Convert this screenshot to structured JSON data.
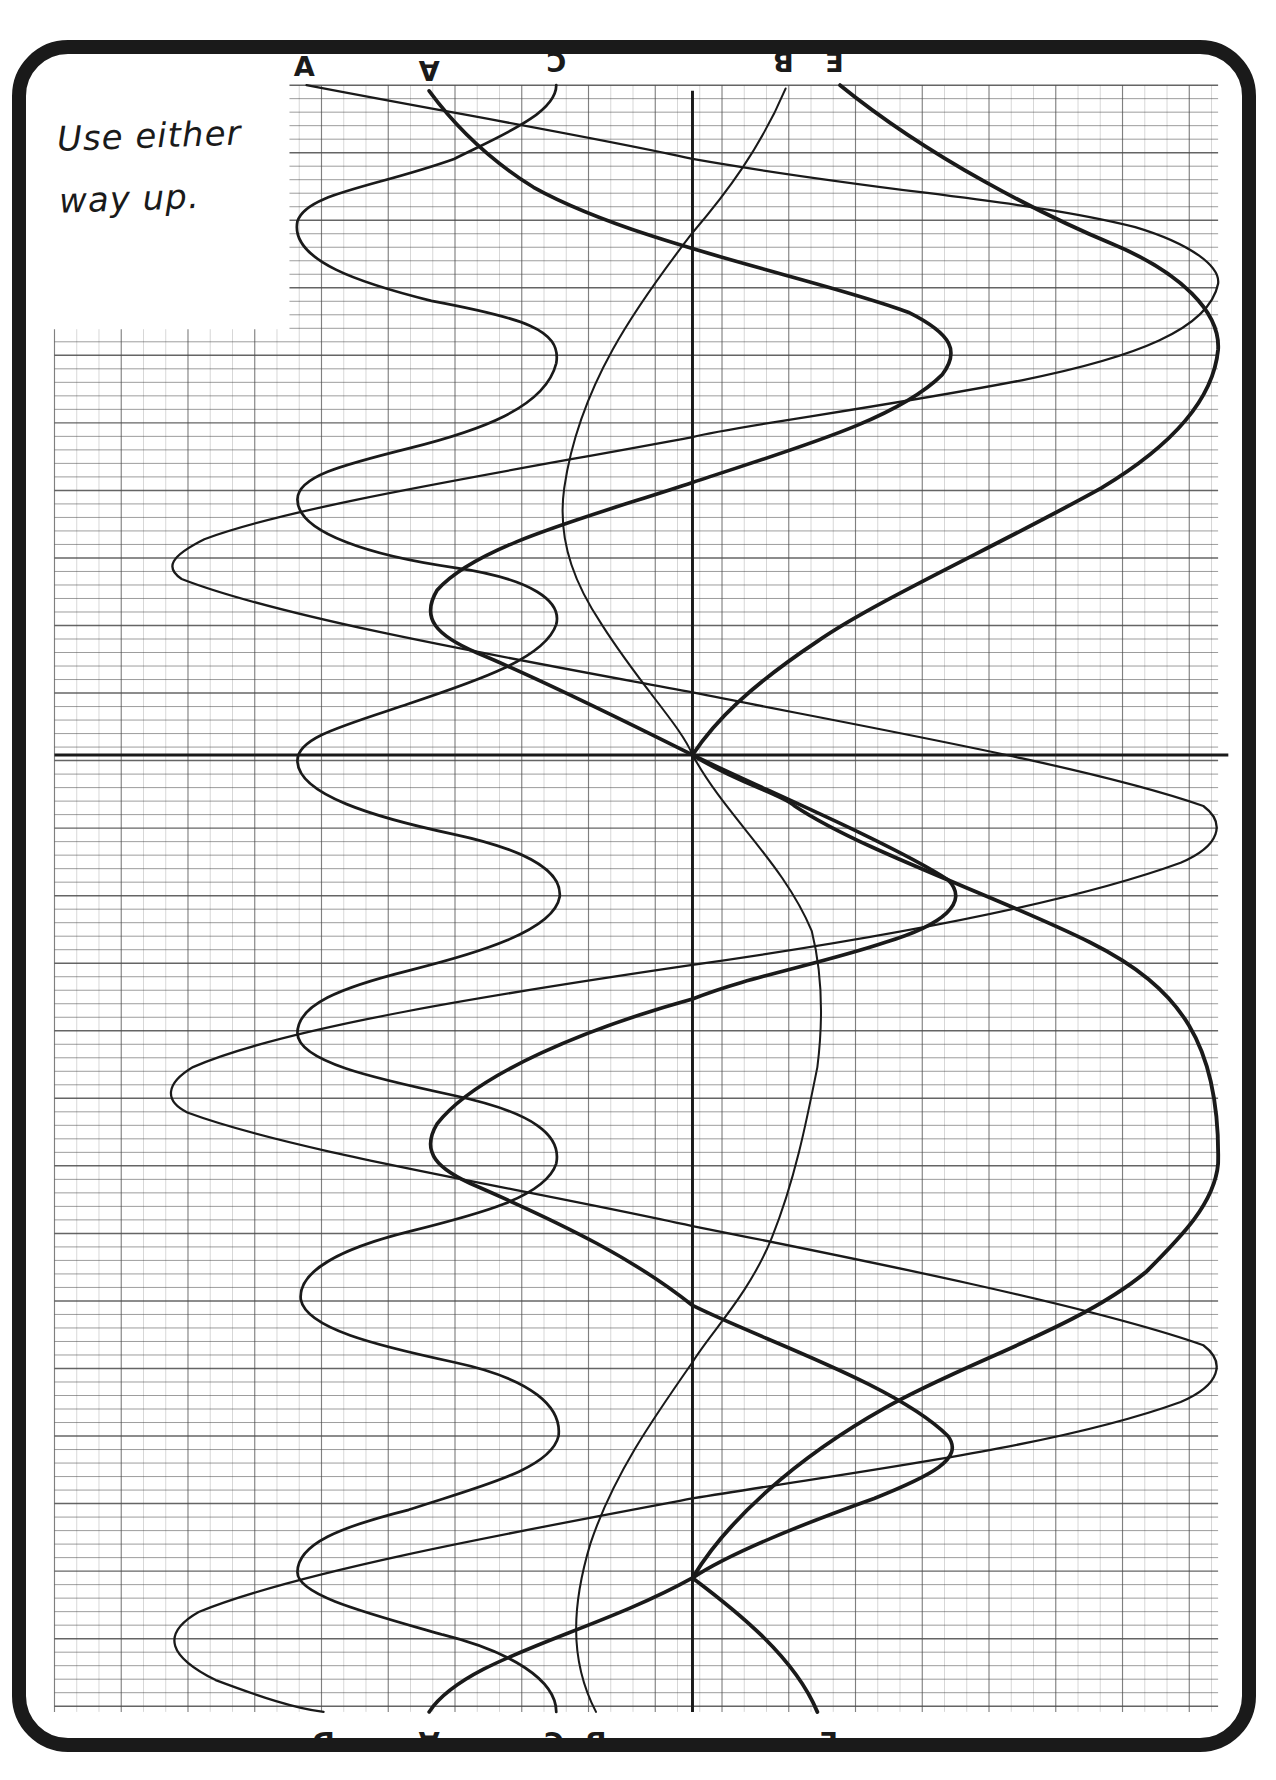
{
  "page": {
    "note_lines": [
      "Use either",
      "way up."
    ],
    "ink_color": "#1a1a1a",
    "grid_color": "#4a4a4a",
    "paper_color": "#ffffff"
  },
  "labels": {
    "top": [
      {
        "text": "A",
        "x": 268,
        "y": 60,
        "rot": 0
      },
      {
        "text": "A",
        "x": 378,
        "y": 60,
        "rot": 180
      },
      {
        "text": "C",
        "x": 490,
        "y": 52,
        "rot": 180
      },
      {
        "text": "B",
        "x": 690,
        "y": 52,
        "rot": 180
      },
      {
        "text": "E",
        "x": 735,
        "y": 52,
        "rot": 180
      }
    ],
    "bottom": [
      {
        "text": "D",
        "x": 285,
        "y": 1532,
        "rot": 180
      },
      {
        "text": "A",
        "x": 378,
        "y": 1532,
        "rot": 180
      },
      {
        "text": "C",
        "x": 488,
        "y": 1532,
        "rot": 180
      },
      {
        "text": "B",
        "x": 525,
        "y": 1532,
        "rot": 180
      },
      {
        "text": "E",
        "x": 730,
        "y": 1532,
        "rot": 180
      }
    ]
  },
  "chart_data": {
    "type": "line",
    "title": "",
    "xlabel": "",
    "ylabel": "",
    "note": "Use either way up.",
    "axes": {
      "origin": [
        610,
        665
      ],
      "x_axis_y": 665,
      "y_axis_x": 610
    },
    "series": [
      {
        "name": "A",
        "stroke_width": 3.2,
        "path": "M378,80 C400,110 430,140 470,165 C560,215 720,245 800,275 C840,295 845,310 830,330 C790,370 700,395 610,425 C520,455 420,480 385,520 C370,545 385,560 420,575 C480,600 560,640 610,665 C660,690 780,740 835,775 C855,795 830,815 780,830 C720,850 660,860 610,880 C520,905 420,945 385,990 C370,1015 385,1030 420,1045 C500,1080 560,1110 610,1150 C670,1180 790,1220 835,1265 C850,1285 820,1300 770,1320 C700,1345 640,1370 610,1390 C520,1440 410,1460 378,1508"
      },
      {
        "name": "B",
        "stroke_width": 1.8,
        "path": "M692,78 C670,130 640,170 610,205 C560,270 510,340 497,430 C490,480 510,520 530,550 C565,605 600,640 610,665 C640,720 690,760 715,820 C725,860 725,900 720,940 C710,990 700,1040 680,1090 C660,1140 625,1175 610,1200 C575,1250 540,1300 520,1360 C505,1410 500,1460 525,1508"
      },
      {
        "name": "C",
        "stroke_width": 2.4,
        "path": "M490,75 C490,100 440,120 400,140 C330,165 270,170 262,195 C255,230 320,250 380,265 C460,280 495,290 490,320 C480,360 420,380 360,395 C300,410 262,420 262,440 C262,470 330,490 400,500 C470,510 495,530 490,550 C480,580 420,600 360,620 C300,640 262,650 262,670 C262,700 330,720 400,735 C470,750 495,770 493,790 C488,820 420,840 360,855 C300,870 262,885 262,910 C262,935 330,950 400,965 C470,980 495,1000 490,1025 C480,1055 420,1070 360,1085 C300,1100 262,1120 265,1145 C270,1170 330,1185 400,1200 C470,1215 495,1240 492,1265 C485,1295 420,1310 360,1330 C300,1345 262,1360 262,1385 C262,1405 320,1420 390,1440 C450,1455 490,1480 490,1508"
      },
      {
        "name": "D",
        "stroke_width": 2.0,
        "path": "M270,75 C400,100 520,120 610,140 C780,170 900,175 1000,200 C1050,215 1075,235 1073,250 C1065,290 1000,315 900,335 C770,360 650,375 610,385 C450,415 260,445 180,475 C150,490 145,500 160,510 C250,545 450,580 610,610 C760,640 960,675 1060,710 C1080,725 1075,745 1040,760 C930,800 750,830 610,850 C440,875 250,905 170,940 C145,955 145,970 165,980 C260,1015 450,1045 610,1080 C760,1110 960,1150 1060,1185 C1080,1200 1075,1220 1040,1235 C930,1275 760,1295 610,1320 C450,1350 260,1385 175,1420 C140,1440 150,1460 190,1480 C230,1495 260,1505 285,1508"
      },
      {
        "name": "E",
        "stroke_width": 3.4,
        "path": "M740,75 C820,140 920,190 980,215 C1040,240 1075,275 1073,308 C1068,360 1020,400 970,430 C880,480 770,530 720,565 C660,605 630,635 610,665 C650,690 690,700 700,710 C760,750 880,790 960,830 C1040,870 1075,920 1073,1025 C1070,1060 1040,1090 1010,1120 C950,1170 850,1200 780,1240 C700,1285 640,1340 610,1390 C650,1420 700,1460 720,1508"
      }
    ]
  }
}
